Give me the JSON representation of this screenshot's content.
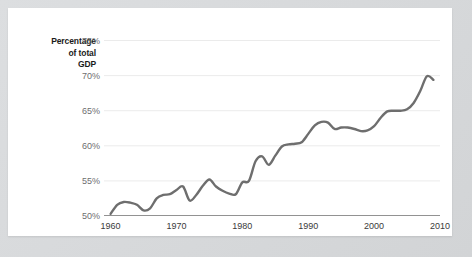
{
  "chart_data": {
    "type": "line",
    "title": "",
    "subtitle": "",
    "xlabel": "",
    "ylabel": "Percentage of total GDP",
    "ylabel_lines": [
      "Percentage",
      "of total",
      "GDP"
    ],
    "xlim": [
      1959,
      2010
    ],
    "ylim": [
      50,
      76.5
    ],
    "yticks": [
      50,
      55,
      60,
      65,
      70,
      75
    ],
    "ytick_labels": [
      "50%",
      "55%",
      "60%",
      "65%",
      "70%",
      "75%"
    ],
    "xticks": [
      1960,
      1970,
      1980,
      1990,
      2000,
      2010
    ],
    "xtick_labels": [
      "1960",
      "1970",
      "1980",
      "1990",
      "2000",
      "2010"
    ],
    "grid": "horizontal",
    "legend": "none",
    "line_color": "#6e6e6e",
    "grid_color": "#ebebeb",
    "axis_color": "#6e6e6e",
    "tick_label_color": "#6d6e70",
    "series": [
      {
        "name": "Consumption share of GDP",
        "x": [
          1960,
          1961,
          1962,
          1963,
          1964,
          1965,
          1966,
          1967,
          1968,
          1969,
          1970,
          1971,
          1972,
          1973,
          1974,
          1975,
          1976,
          1977,
          1978,
          1979,
          1980,
          1981,
          1982,
          1983,
          1984,
          1985,
          1986,
          1987,
          1988,
          1989,
          1990,
          1991,
          1992,
          1993,
          1994,
          1995,
          1996,
          1997,
          1998,
          1999,
          2000,
          2001,
          2002,
          2003,
          2004,
          2005,
          2006,
          2007,
          2008,
          2009
        ],
        "values": [
          50.3,
          51.6,
          52.0,
          51.9,
          51.6,
          50.8,
          51.1,
          52.5,
          53.0,
          53.1,
          53.7,
          54.2,
          52.2,
          53.0,
          54.3,
          55.2,
          54.2,
          53.6,
          53.2,
          53.1,
          54.8,
          55.0,
          57.8,
          58.5,
          57.3,
          58.6,
          59.9,
          60.2,
          60.3,
          60.5,
          61.7,
          62.9,
          63.4,
          63.3,
          62.4,
          62.6,
          62.6,
          62.4,
          62.1,
          62.2,
          62.8,
          64.0,
          64.9,
          65.0,
          65.0,
          65.2,
          66.1,
          67.8,
          69.9,
          69.4
        ]
      }
    ]
  }
}
